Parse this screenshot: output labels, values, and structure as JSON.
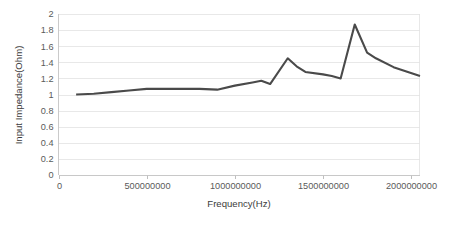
{
  "chart_data": {
    "type": "line",
    "title": "",
    "xlabel": "Frequency(Hz)",
    "ylabel": "Input Impedance(Ohm)",
    "xlim": [
      0,
      2050000000
    ],
    "ylim": [
      0,
      2
    ],
    "grid": true,
    "legend": "none",
    "x_ticks": [
      0,
      500000000,
      1000000000,
      1500000000,
      2000000000
    ],
    "x_tick_labels": [
      "0",
      "500000000",
      "1000000000",
      "1500000000",
      "2000000000"
    ],
    "y_ticks": [
      0,
      0.2,
      0.4,
      0.6,
      0.8,
      1,
      1.2,
      1.4,
      1.6,
      1.8,
      2
    ],
    "y_tick_labels": [
      "0",
      "0.2",
      "0.4",
      "0.6",
      "0.8",
      "1",
      "1.2",
      "1.4",
      "1.6",
      "1.8",
      "2"
    ],
    "series": [
      {
        "name": "Input Impedance",
        "color": "#4a4a4a",
        "x": [
          100000000,
          200000000,
          300000000,
          400000000,
          500000000,
          600000000,
          700000000,
          800000000,
          900000000,
          1000000000,
          1100000000,
          1150000000,
          1200000000,
          1300000000,
          1350000000,
          1400000000,
          1500000000,
          1550000000,
          1600000000,
          1680000000,
          1750000000,
          1800000000,
          1900000000,
          2050000000
        ],
        "y": [
          1.0,
          1.01,
          1.03,
          1.05,
          1.07,
          1.07,
          1.07,
          1.07,
          1.06,
          1.11,
          1.15,
          1.17,
          1.13,
          1.45,
          1.35,
          1.28,
          1.25,
          1.23,
          1.2,
          1.87,
          1.52,
          1.45,
          1.34,
          1.23
        ]
      }
    ]
  },
  "colors": {
    "series": "#4a4a4a",
    "grid": "#e2e2e2",
    "axis": "#c4c4c4",
    "text": "#5a5a5a",
    "background": "#ffffff"
  }
}
